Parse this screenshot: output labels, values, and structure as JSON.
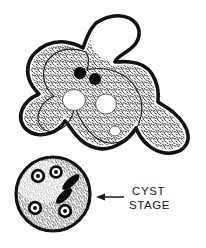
{
  "figure": {
    "background_color": "#ffffff",
    "ink_color": "#111111",
    "style": "stippled black-and-white scientific line drawing"
  },
  "labels": {
    "cyst_line1": "CYST",
    "cyst_line2": "STAGE"
  },
  "annotations": {
    "arrow": {
      "name": "cyst-stage-arrow",
      "direction": "left",
      "points_to": "cyst",
      "tail_x": 124,
      "tail_y": 197,
      "head_x": 97,
      "head_y": 197
    }
  },
  "trophozoite": {
    "name": "amoeba-trophozoite",
    "nuclei_count": 2,
    "nuclei": [
      {
        "cx": 80,
        "cy": 73,
        "r": 6.2
      },
      {
        "cx": 95,
        "cy": 79,
        "r": 6.0
      }
    ],
    "vacuoles_count": 3,
    "vacuoles": [
      {
        "cx": 74,
        "cy": 100,
        "rx": 11.5,
        "ry": 10.5
      },
      {
        "cx": 106,
        "cy": 104,
        "rx": 10.5,
        "ry": 10.0
      },
      {
        "cx": 115,
        "cy": 131,
        "rx": 5.5,
        "ry": 5.0
      }
    ],
    "pseudopodia_count": 4,
    "pseudopodia": [
      "upper-right finger",
      "left lobe",
      "lower-right tail",
      "lower lobe"
    ]
  },
  "cyst": {
    "name": "amoeba-cyst",
    "center_x": 53,
    "center_y": 194,
    "radius": 38,
    "nuclei_count": 4,
    "nuclei": [
      {
        "cx": 38,
        "cy": 176,
        "r": 7.0
      },
      {
        "cx": 56,
        "cy": 172,
        "r": 6.5
      },
      {
        "cx": 35,
        "cy": 208,
        "r": 7.0
      },
      {
        "cx": 65,
        "cy": 211,
        "r": 7.0
      }
    ],
    "chromatoid_bodies_count": 2,
    "chromatoid_bodies": [
      {
        "cx": 70,
        "cy": 183,
        "rx": 11,
        "ry": 4,
        "angle": -40
      },
      {
        "cx": 64,
        "cy": 195,
        "rx": 10,
        "ry": 4,
        "angle": -42
      }
    ]
  }
}
